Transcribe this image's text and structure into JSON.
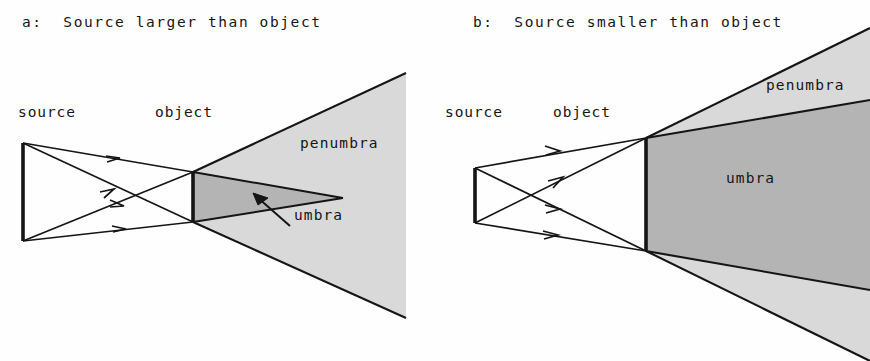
{
  "figure": {
    "background_color": "#fefefe",
    "ink_color": "#151515",
    "umbra_fill": "#b4b4b4",
    "penumbra_fill": "#d9d9d9"
  },
  "panels": [
    {
      "id": "a",
      "title": "a:  Source larger than object",
      "source_label": "source",
      "object_label": "object",
      "penumbra_label": "penumbra",
      "umbra_label": "umbra",
      "geometry": {
        "source_x": 23,
        "source_top_y": 143,
        "source_bottom_y": 241,
        "object_x": 193,
        "object_top_y": 172,
        "object_bottom_y": 222,
        "umbra_apex_x": 343,
        "umbra_apex_y": 198,
        "penumbra_clip_x": 406,
        "penumbra_top_y": 73,
        "penumbra_bottom_y": 318
      },
      "label_positions": {
        "title_x": 22,
        "title_y": 22,
        "source_x": 18,
        "source_y": 112,
        "object_x": 155,
        "object_y": 112,
        "penumbra_x": 300,
        "penumbra_y": 143,
        "umbra_x": 294,
        "umbra_y": 215
      }
    },
    {
      "id": "b",
      "title": "b:  Source smaller than object",
      "source_label": "source",
      "object_label": "object",
      "penumbra_label": "penumbra",
      "umbra_label": "umbra",
      "geometry": {
        "source_x": 40,
        "source_top_y": 168,
        "source_bottom_y": 223,
        "object_x": 211,
        "object_top_y": 138,
        "object_bottom_y": 251,
        "clip_x": 435,
        "umbra_top_edge_end_y": 100,
        "umbra_bottom_edge_end_y": 290,
        "penumbra_top_edge_end_y": 28,
        "penumbra_bottom_edge_end_y": 361
      },
      "label_positions": {
        "title_x": 38,
        "title_y": 22,
        "source_x": 10,
        "source_y": 112,
        "object_x": 118,
        "object_y": 112,
        "penumbra_x": 331,
        "penumbra_y": 84,
        "umbra_x": 291,
        "umbra_y": 177
      }
    }
  ]
}
